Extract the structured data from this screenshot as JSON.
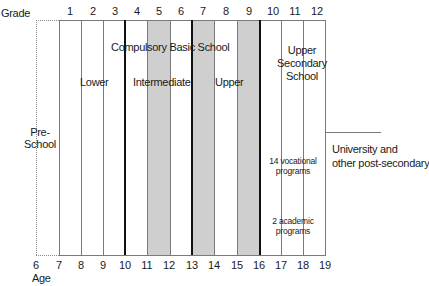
{
  "title_axis": {
    "grade_label": "Grade",
    "age_label": "Age"
  },
  "grades": [
    "1",
    "2",
    "3",
    "4",
    "5",
    "6",
    "7",
    "8",
    "9",
    "10",
    "11",
    "12"
  ],
  "ages": [
    "6",
    "7",
    "8",
    "9",
    "10",
    "11",
    "12",
    "13",
    "14",
    "15",
    "16",
    "17",
    "18",
    "19"
  ],
  "stages": {
    "preschool": "Pre-\nSchool",
    "preschool_line1": "Pre-",
    "preschool_line2": "School",
    "compulsory": "Compulsory Basic School",
    "lower": "Lower",
    "intermediate": "Intermediate",
    "upper": "Upper",
    "upper_secondary_line1": "Upper",
    "upper_secondary_line2": "Secondary",
    "upper_secondary_line3": "School",
    "vocational_line1": "14 vocational",
    "vocational_line2": "programs",
    "academic_line1": "2 academic",
    "academic_line2": "programs",
    "university_line1": "University and",
    "university_line2": "other post-secondary"
  },
  "colors": {
    "shade": "#cfcfcf",
    "thick_line": "#111111",
    "thin_line": "#7a7a7a"
  }
}
